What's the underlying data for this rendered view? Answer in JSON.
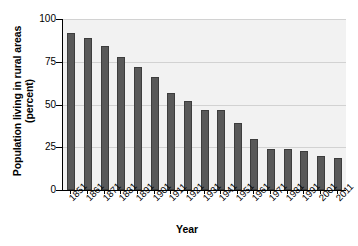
{
  "chart_data": {
    "type": "bar",
    "title": "",
    "xlabel": "Year",
    "ylabel": "Population living in rural areas (percent)",
    "ylabel_line1": "Population living in rural areas",
    "ylabel_line2": "(percent)",
    "categories": [
      "1851",
      "1861",
      "1871",
      "1881",
      "1891",
      "1901",
      "1911",
      "1921",
      "1931",
      "1941",
      "1951",
      "1961",
      "1971",
      "1981",
      "1991",
      "2001",
      "2011"
    ],
    "values": [
      92,
      89,
      84,
      78,
      72,
      66,
      57,
      52,
      47,
      47,
      39,
      30,
      24,
      24,
      23,
      20,
      19
    ],
    "ylim": [
      0,
      100
    ],
    "yticks": [
      0,
      25,
      50,
      75,
      100
    ],
    "ytick_labels": [
      "0",
      "25",
      "50",
      "75",
      "100"
    ],
    "grid": true,
    "legend": false,
    "legend_position": "none",
    "bar_color": "#595959",
    "plot_background": "#f2f2f2",
    "gridline_color": "#d2d2d2",
    "axis_color": "#000000"
  }
}
